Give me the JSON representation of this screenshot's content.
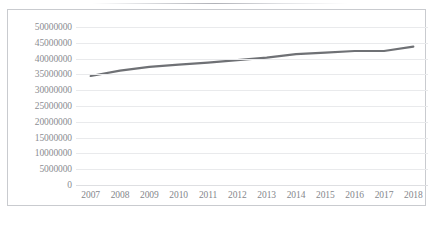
{
  "chart_data": {
    "type": "line",
    "title": "",
    "subtitle": "",
    "xlabel": "",
    "ylabel": "",
    "x": [
      2007,
      2008,
      2009,
      2010,
      2011,
      2012,
      2013,
      2014,
      2015,
      2016,
      2017,
      2018
    ],
    "categories": [
      "2007",
      "2008",
      "2009",
      "2010",
      "2011",
      "2012",
      "2013",
      "2014",
      "2015",
      "2016",
      "2017",
      "2018"
    ],
    "series": [
      {
        "name": "",
        "values": [
          34500000,
          36200000,
          37400000,
          38100000,
          38700000,
          39500000,
          40300000,
          41400000,
          41900000,
          42400000,
          42400000,
          43800000
        ],
        "color": "#6f7175"
      }
    ],
    "ylim": [
      0,
      50000000
    ],
    "ytick_labels": [
      "50000000",
      "45000000",
      "40000000",
      "35000000",
      "30000000",
      "25000000",
      "20000000",
      "15000000",
      "10000000",
      "5000000",
      "0"
    ],
    "ytick_values": [
      50000000,
      45000000,
      40000000,
      35000000,
      30000000,
      25000000,
      20000000,
      15000000,
      10000000,
      5000000,
      0
    ],
    "ytick_step": 5000000,
    "xtick_labels": [
      "2007",
      "2008",
      "2009",
      "2010",
      "2011",
      "2012",
      "2013",
      "2014",
      "2015",
      "2016",
      "2017",
      "2018"
    ],
    "grid": {
      "horizontal": true,
      "vertical": false,
      "color": "#e9eaec"
    },
    "legend": {
      "visible": false,
      "position": "none",
      "entries": []
    },
    "plot_border": {
      "visible": true,
      "color": "#c9cbcf"
    },
    "background_color": "#ffffff"
  }
}
